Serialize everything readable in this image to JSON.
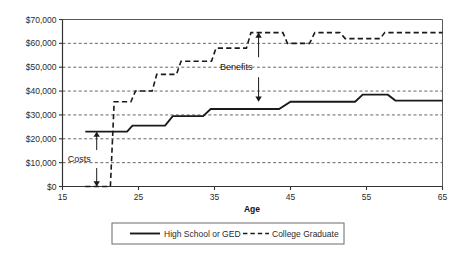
{
  "chart_data": {
    "type": "line",
    "title": "",
    "xlabel": "Age",
    "ylabel": "",
    "xlim": [
      15,
      65
    ],
    "ylim": [
      0,
      70000
    ],
    "xticks": [
      15,
      25,
      35,
      45,
      55,
      65
    ],
    "xtick_labels": [
      "15",
      "25",
      "35",
      "45",
      "55",
      "65"
    ],
    "yticks": [
      0,
      10000,
      20000,
      30000,
      40000,
      50000,
      60000,
      70000
    ],
    "ytick_labels": [
      "$0",
      "$10,000",
      "$20,000",
      "$30,000",
      "$40,000",
      "$50,000",
      "$60,000",
      "$70,000"
    ],
    "grid": true,
    "grid_style": "dashed-horizontal",
    "legend_position": "bottom",
    "series": [
      {
        "name": "High School or GED",
        "style": "solid",
        "color": "#1a1a1a",
        "x": [
          18,
          23.5,
          24.2,
          28.5,
          29.5,
          33.5,
          34.5,
          43.5,
          45.0,
          53.5,
          54.5,
          57.8,
          58.8,
          65
        ],
        "values": [
          23000,
          23000,
          25500,
          25500,
          29500,
          29500,
          32500,
          32500,
          35500,
          35500,
          38500,
          38500,
          36000,
          36000
        ]
      },
      {
        "name": "College Graduate",
        "style": "dashed",
        "color": "#1a1a1a",
        "x": [
          18,
          21.3,
          21.8,
          24.0,
          24.6,
          26.8,
          27.4,
          30.0,
          30.6,
          34.6,
          35.2,
          39.2,
          39.8,
          44.0,
          44.6,
          47.5,
          48.2,
          51.5,
          52.2,
          56.8,
          57.4,
          65
        ],
        "values": [
          0,
          0,
          35500,
          35500,
          40000,
          40000,
          47000,
          47000,
          52500,
          52500,
          58000,
          58000,
          64500,
          64500,
          60000,
          60000,
          64500,
          64500,
          62000,
          62000,
          64500,
          64500
        ]
      }
    ],
    "annotations": [
      {
        "label": "Costs",
        "type": "double-arrow-vertical",
        "x": 19.5,
        "y_top": 23000,
        "y_bottom": 0,
        "description": "Gap between High School earnings and zero college-graduate earnings during schooling years"
      },
      {
        "label": "Benefits",
        "type": "double-arrow-vertical",
        "x": 40.8,
        "y_top": 64500,
        "y_bottom": 35500,
        "description": "Gap between College Graduate earnings and High School earnings after graduation"
      }
    ]
  },
  "legend": {
    "items": [
      {
        "label": "High School or GED",
        "style": "solid"
      },
      {
        "label": "College Graduate",
        "style": "dashed"
      }
    ]
  }
}
